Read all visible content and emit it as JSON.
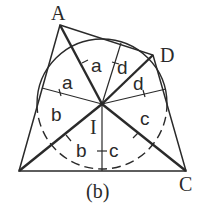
{
  "diagram": {
    "caption": "(b)",
    "vertices": {
      "A": {
        "label": "A",
        "x": 60,
        "y": 25
      },
      "D": {
        "label": "D",
        "x": 153,
        "y": 55
      },
      "C": {
        "label": "C",
        "x": 186,
        "y": 171
      },
      "B": {
        "label": "",
        "x": 19,
        "y": 171
      }
    },
    "incenter": {
      "label": "I",
      "x": 102,
      "y": 104
    },
    "incircle_radius": 65,
    "tangent_points": {
      "left": {
        "x": 42,
        "y": 88
      },
      "top": {
        "x": 121,
        "y": 43
      },
      "right": {
        "x": 166,
        "y": 89
      },
      "bottom": {
        "x": 102,
        "y": 171
      }
    },
    "segment_labels": [
      {
        "id": "a1",
        "text": "a"
      },
      {
        "id": "a2",
        "text": "a"
      },
      {
        "id": "d1",
        "text": "d"
      },
      {
        "id": "d2",
        "text": "d"
      },
      {
        "id": "b1",
        "text": "b"
      },
      {
        "id": "b2",
        "text": "b"
      },
      {
        "id": "c1",
        "text": "c"
      },
      {
        "id": "c2",
        "text": "c"
      }
    ],
    "colors": {
      "stroke": "#2a2a2a",
      "background": "#ffffff"
    }
  }
}
